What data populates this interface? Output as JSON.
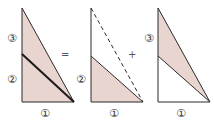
{
  "diagram": {
    "title": "",
    "fill_color": "#e8d5cf",
    "stroke_color": "#2a2a2a",
    "operators": {
      "equals": "=",
      "plus": "+"
    },
    "figures": [
      {
        "id": "whole-triangle",
        "description": "Right triangle divided by a line from the left side to the bottom-right vertex; entire triangle shaded",
        "labels": {
          "upper_left": "③",
          "lower_left": "②",
          "bottom": "①"
        }
      },
      {
        "id": "lower-triangle",
        "description": "Outline of full triangle with dashed hypotenuse; lower sub-triangle shaded",
        "labels": {
          "lower_left": "②",
          "bottom": "①"
        }
      },
      {
        "id": "upper-sliver",
        "description": "Outline of full triangle; upper thin sliver between hypotenuse and dividing line shaded",
        "labels": {
          "upper_left": "③",
          "bottom": "①"
        }
      }
    ]
  }
}
